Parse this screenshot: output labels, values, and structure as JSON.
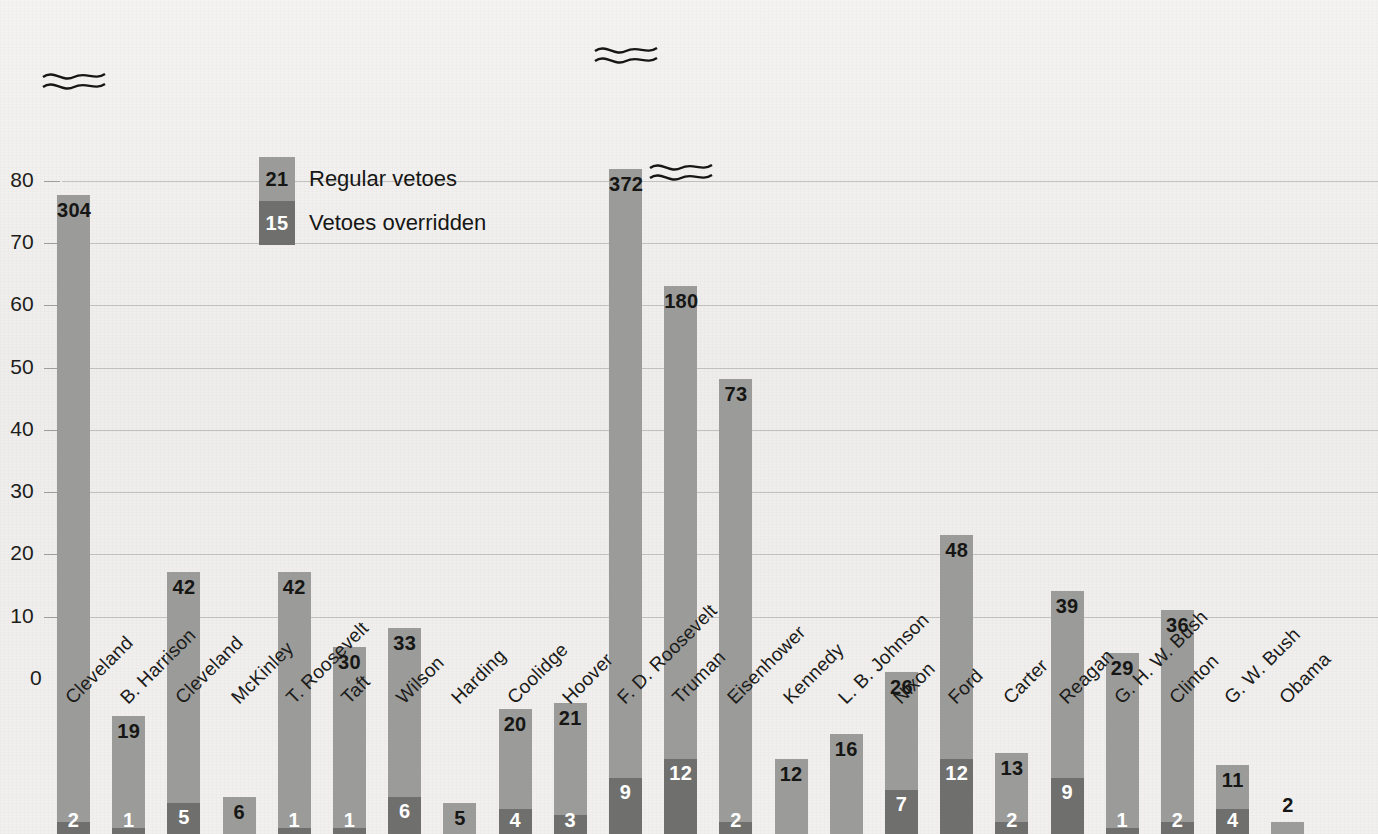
{
  "chart_data": {
    "type": "bar",
    "stacked": true,
    "title": "",
    "subtitle": "",
    "xlabel": "",
    "ylabel": "",
    "ylim": [
      0,
      88
    ],
    "yticks": [
      0,
      10,
      20,
      30,
      40,
      50,
      60,
      70,
      80
    ],
    "grid": true,
    "legend_position": "inside-top-left",
    "categories": [
      "Cleveland",
      "B. Harrison",
      "Cleveland",
      "McKinley",
      "T. Roosevelt",
      "Taft",
      "Wilson",
      "Harding",
      "Coolidge",
      "Hoover",
      "F. D. Roosevelt",
      "Truman",
      "Eisenhower",
      "Kennedy",
      "L. B. Johnson",
      "Nixon",
      "Ford",
      "Carter",
      "Reagan",
      "G. H. W. Bush",
      "Clinton",
      "G. W. Bush",
      "Obama"
    ],
    "series": [
      {
        "name": "Regular vetoes",
        "color": "#9b9b99",
        "values": [
          304,
          19,
          42,
          6,
          42,
          30,
          33,
          5,
          20,
          21,
          372,
          180,
          73,
          12,
          16,
          26,
          48,
          13,
          39,
          29,
          36,
          11,
          2
        ]
      },
      {
        "name": "Vetoes overridden",
        "color": "#6f6f6d",
        "values": [
          2,
          1,
          5,
          0,
          1,
          1,
          6,
          0,
          4,
          3,
          9,
          12,
          2,
          0,
          0,
          7,
          12,
          2,
          9,
          1,
          2,
          4,
          0
        ]
      }
    ],
    "axis_breaks": [
      {
        "category": "Cleveland",
        "value": 304
      },
      {
        "category": "F. D. Roosevelt",
        "value": 372
      },
      {
        "category": "Truman",
        "value": 180
      }
    ]
  },
  "legend": {
    "items": [
      {
        "value": "21",
        "label": "Regular vetoes",
        "swatch": "regular"
      },
      {
        "value": "15",
        "label": "Vetoes overridden",
        "swatch": "override"
      }
    ]
  },
  "colors": {
    "regular": "#9b9b99",
    "override": "#6f6f6d",
    "gridline": "#b9b8b4",
    "background": "#f2f1ef",
    "text": "#161615"
  }
}
